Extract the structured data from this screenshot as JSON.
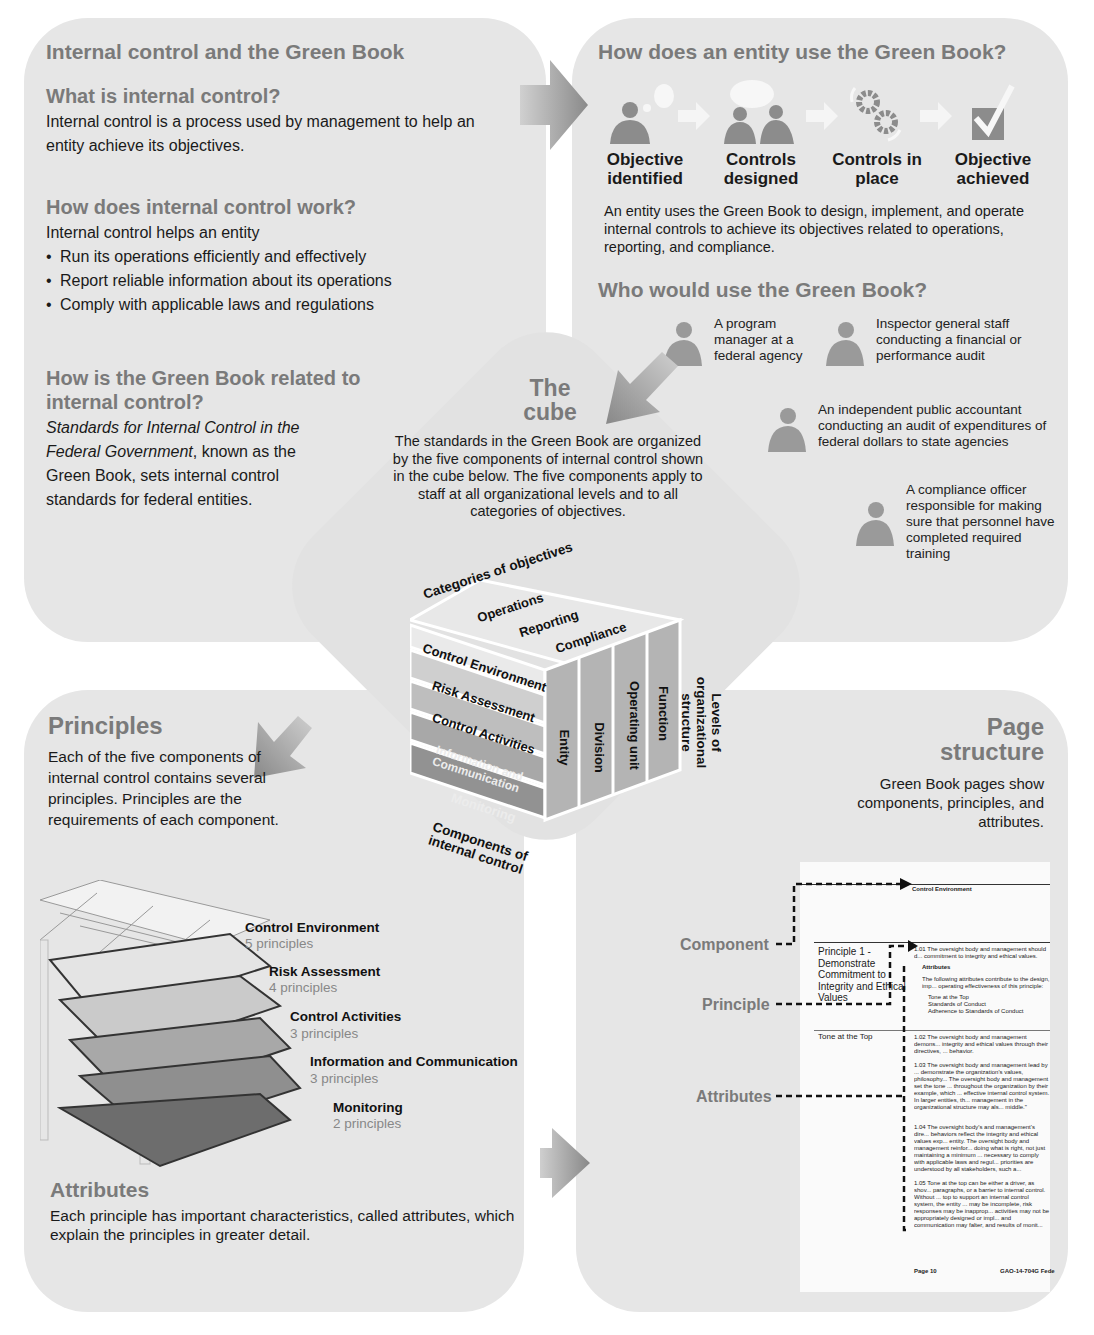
{
  "top_left": {
    "title": "Internal control and the Green Book",
    "what_heading": "What is internal control?",
    "what_body": "Internal control is a process used by management to help an entity achieve its objectives.",
    "how_heading": "How does internal control work?",
    "how_intro": "Internal control helps an entity",
    "how_bullets": [
      "Run its operations efficiently and effectively",
      "Report reliable information about its operations",
      "Comply with applicable laws and regulations"
    ],
    "related_heading": "How is the Green Book related to internal control?",
    "related_italic": "Standards for Internal Control in the Federal Government",
    "related_body": ", known as the Green Book, sets internal control standards for federal entities."
  },
  "top_right": {
    "title": "How does an entity use the Green Book?",
    "steps": [
      {
        "label": "Objective identified",
        "icon": "person-lightbulb-icon"
      },
      {
        "label": "Controls designed",
        "icon": "two-people-speech-icon"
      },
      {
        "label": "Controls in place",
        "icon": "gears-icon"
      },
      {
        "label": "Objective achieved",
        "icon": "checkbox-icon"
      }
    ],
    "body": "An entity uses the Green Book to design, implement, and operate internal controls to achieve its objectives related to operations, reporting, and compliance.",
    "who_heading": "Who would use the Green Book?",
    "users": [
      "A program manager at a federal agency",
      "Inspector general staff conducting a financial or performance audit",
      "An independent public accountant conducting an audit of expenditures of federal dollars to state agencies",
      "A compliance officer responsible for making sure that personnel have completed required training"
    ]
  },
  "cube": {
    "title_line1": "The",
    "title_line2": "cube",
    "body": "The standards in the Green Book are organized by the five components of internal control shown in the cube below. The five components apply to staff at all organizational levels and to all categories of objectives.",
    "categories_label": "Categories of objectives",
    "categories": [
      "Operations",
      "Reporting",
      "Compliance"
    ],
    "components_label": "Components of internal control",
    "components": [
      "Control Environment",
      "Risk Assessment",
      "Control Activities",
      "Information and Communication",
      "Monitoring"
    ],
    "levels_label": "Levels of organizational structure",
    "levels": [
      "Entity",
      "Division",
      "Operating unit",
      "Function"
    ]
  },
  "bottom_left": {
    "principles_heading": "Principles",
    "principles_body": "Each of the five components of internal control contains several principles.  Principles are the requirements of each component.",
    "layers": [
      {
        "name": "Control Environment",
        "count": "5 principles"
      },
      {
        "name": "Risk Assessment",
        "count": "4 principles"
      },
      {
        "name": "Control Activities",
        "count": "3 principles"
      },
      {
        "name": "Information and Communication",
        "count": "3 principles"
      },
      {
        "name": "Monitoring",
        "count": "2 principles"
      }
    ],
    "attributes_heading": "Attributes",
    "attributes_body": "Each principle has important characteristics, called attributes, which explain the principles in greater detail."
  },
  "bottom_right": {
    "title_line1": "Page",
    "title_line2": "structure",
    "body": "Green Book pages show components, principles, and attributes.",
    "callouts": [
      "Component",
      "Principle",
      "Attributes"
    ],
    "sample_page": {
      "component": "Control Environment",
      "principle": "Principle 1 - Demonstrate Commitment to Integrity and Ethical Values",
      "para_101": "1.01 The oversight body and management should d... commitment to integrity and ethical values.",
      "attributes_label": "Attributes",
      "attributes_intro": "The following attributes contribute to the design, imp... operating effectiveness of this principle:",
      "attribute_list": [
        "Tone at the Top",
        "Standards of Conduct",
        "Adherence to Standards of Conduct"
      ],
      "attribute_name": "Tone at the Top",
      "para_102": "1.02 The oversight body and management demons... integrity and ethical values through their directives, ... behavior.",
      "para_103": "1.03 The oversight body and management lead by ... demonstrate the organization's values, philosophy... The oversight body and management set the tone ... throughout the organization by their example, which ... effective internal control system. In larger entities, th... management in the organizational structure may als... middle.\"",
      "para_104": "1.04 The oversight body's and management's dire... behaviors reflect the integrity and ethical values exp... entity. The oversight body and management reinfor... doing what is right, not just maintaining  a minimum ... necessary to comply with applicable laws and regul... priorities are understood by all stakeholders, such a... employees, and the general public.",
      "para_105": "1.05 Tone at the top can be either a driver, as  shov... paragraphs, or a barrier to internal control. Without ... top to support an internal control system, the entity ... may be incomplete, risk responses may be inapprop... activities may not be appropriately designed or impl... and communication may falter, and results of monit... understood or acted upon to remediate deficiencies.",
      "footer_left": "Page 10",
      "footer_right": "GAO-14-704G  Fede"
    }
  },
  "colors": {
    "panel": "#e6e6e6",
    "heading_gray": "#7a7a7a",
    "arrow_gray": "#8a8a8a"
  }
}
